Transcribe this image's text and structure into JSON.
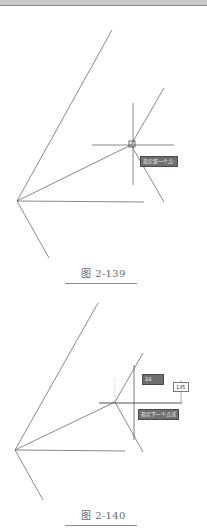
{
  "figures": [
    {
      "caption": "图 2-139",
      "tooltip": "指定第一个点:"
    },
    {
      "caption": "图 2-140",
      "length_input": "24",
      "angle_input": "135",
      "tooltip": "指定下一个点或"
    }
  ],
  "colors": {
    "line": "#6a6a6a",
    "tooltip_bg": "#6f6f6f",
    "caption": "#6a6a6a"
  }
}
